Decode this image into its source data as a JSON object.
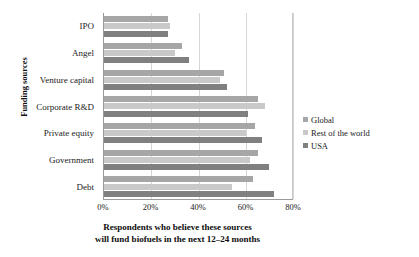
{
  "chart_data": {
    "type": "bar",
    "orientation": "horizontal",
    "title": "",
    "xlabel": "Respondents who believe these sources will fund biofuels in the next 12–24 months",
    "xlabel_line1": "Respondents who believe these sources",
    "xlabel_line2": "will fund biofuels in the next 12–24 months",
    "ylabel": "Funding sources",
    "categories": [
      "IPO",
      "Angel",
      "Venture capital",
      "Corporate R&D",
      "Private equity",
      "Government",
      "Debt"
    ],
    "series": [
      {
        "name": "Global",
        "color": "#a6a6a6",
        "values": [
          27,
          33,
          51,
          65,
          64,
          65,
          63
        ]
      },
      {
        "name": "Rest of the world",
        "color": "#c9c9c9",
        "values": [
          28,
          30,
          49,
          68,
          60,
          62,
          54
        ]
      },
      {
        "name": "USA",
        "color": "#808080",
        "values": [
          27,
          36,
          52,
          61,
          67,
          70,
          72
        ]
      }
    ],
    "xlim": [
      0,
      80
    ],
    "xticks": [
      0,
      20,
      40,
      60,
      80
    ],
    "xtick_labels": [
      "0%",
      "20%",
      "40%",
      "60%",
      "80%"
    ],
    "grid": true,
    "grid_axis": "x",
    "legend_position": "right"
  },
  "legend": {
    "items": [
      {
        "label": "Global"
      },
      {
        "label": "Rest of the world"
      },
      {
        "label": "USA"
      }
    ]
  }
}
